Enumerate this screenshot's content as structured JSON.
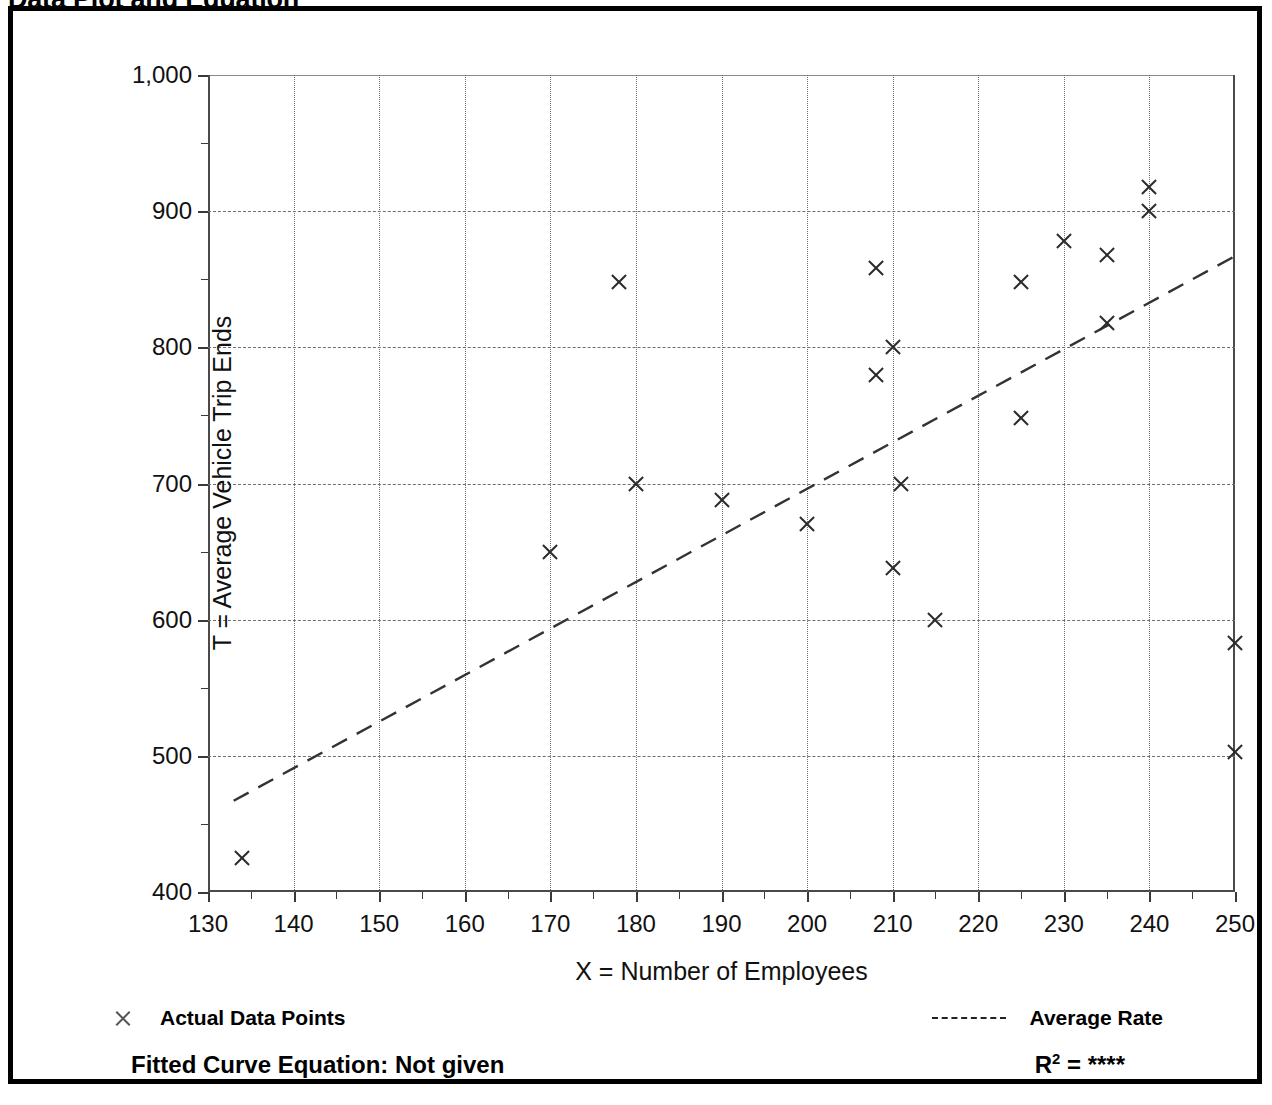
{
  "title": "Data Plot and Equation",
  "axis_titles": {
    "x": "X = Number of Employees",
    "y": "T = Average Vehicle Trip Ends"
  },
  "legend": {
    "points_label": "Actual Data Points",
    "rate_label": "Average Rate",
    "points_marker": "x-marker-icon",
    "rate_marker": "dashed-line-icon"
  },
  "equation": {
    "fitted_label": "Fitted Curve Equation:  Not given",
    "r_squared_prefix": "R",
    "r_squared_exponent": "2",
    "r_squared_equals": " = ",
    "r_squared_value": "****"
  },
  "colors": {
    "frame": "#000000",
    "axis": "#4a4a4a",
    "grid": "#6e6e6e",
    "marker": "#2b2b2b",
    "trend": "#333333",
    "background": "#ffffff"
  },
  "chart_data": {
    "type": "scatter",
    "title": "Data Plot and Equation",
    "xlabel": "X = Number of Employees",
    "ylabel": "T = Average Vehicle Trip Ends",
    "xlim": [
      130,
      250
    ],
    "ylim": [
      400,
      1000
    ],
    "grid": true,
    "legend_position": "below-plot",
    "x_ticks": [
      130,
      140,
      150,
      160,
      170,
      180,
      190,
      200,
      210,
      220,
      230,
      240,
      250
    ],
    "x_tick_labels": [
      "130",
      "140",
      "150",
      "160",
      "170",
      "180",
      "190",
      "200",
      "210",
      "220",
      "230",
      "240",
      "250"
    ],
    "x_minor_ticks": [
      135,
      145,
      155,
      165,
      175,
      185,
      195,
      205,
      215,
      225,
      235,
      245
    ],
    "y_ticks": [
      400,
      500,
      600,
      700,
      800,
      900,
      1000
    ],
    "y_tick_labels": [
      "400",
      "500",
      "600",
      "700",
      "800",
      "900",
      "1,000"
    ],
    "y_minor_ticks": [
      450,
      550,
      650,
      750,
      850,
      950
    ],
    "series": [
      {
        "name": "Actual Data Points",
        "marker": "x",
        "points": [
          [
            134,
            425
          ],
          [
            170,
            650
          ],
          [
            178,
            848
          ],
          [
            180,
            700
          ],
          [
            190,
            688
          ],
          [
            200,
            670
          ],
          [
            208,
            858
          ],
          [
            208,
            780
          ],
          [
            210,
            800
          ],
          [
            211,
            700
          ],
          [
            210,
            638
          ],
          [
            215,
            600
          ],
          [
            225,
            848
          ],
          [
            225,
            748
          ],
          [
            230,
            878
          ],
          [
            235,
            868
          ],
          [
            235,
            818
          ],
          [
            240,
            918
          ],
          [
            240,
            900
          ],
          [
            250,
            583
          ],
          [
            250,
            503
          ]
        ]
      },
      {
        "name": "Average Rate",
        "style": "dashed-line",
        "line": [
          [
            133,
            467
          ],
          [
            250,
            867
          ]
        ]
      }
    ]
  }
}
